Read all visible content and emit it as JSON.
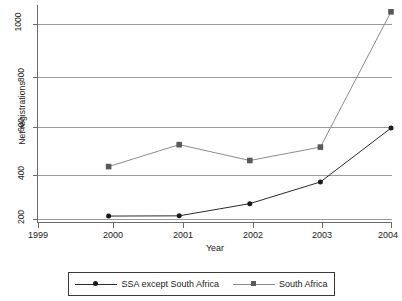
{
  "chart_data": {
    "type": "line",
    "title": "",
    "subtitle": "",
    "xlabel": "Year",
    "ylabel": "Net registrations",
    "x": [
      1999,
      2000,
      2001,
      2002,
      2003,
      2004
    ],
    "x_tick_labels": [
      "1999",
      "2000",
      "2001",
      "2002",
      "2003",
      "2004"
    ],
    "y_tick_labels": [
      "200",
      "400",
      "600",
      "800",
      "1000"
    ],
    "y_ticks": [
      200,
      400,
      600,
      800,
      1000
    ],
    "xlim": [
      1999,
      2004
    ],
    "ylim": [
      180,
      1085
    ],
    "grid": "horizontal",
    "legend_position": "bottom",
    "series": [
      {
        "name": "SSA except South Africa",
        "marker": "circle",
        "color": "#2b2b2b",
        "marker_color": "#1a1a1a",
        "x": [
          2000,
          2001,
          2002,
          2003,
          2004
        ],
        "values": [
          212,
          213,
          263,
          352,
          573
        ]
      },
      {
        "name": "South Africa",
        "marker": "square",
        "color": "#8c8c8c",
        "marker_color": "#595959",
        "x": [
          2000,
          2001,
          2002,
          2003,
          2004
        ],
        "values": [
          415,
          505,
          440,
          495,
          1050
        ]
      }
    ]
  },
  "axes": {
    "y_title": "Net registrations",
    "x_title": "Year"
  },
  "legend": {
    "entries": [
      {
        "label": "SSA except South Africa",
        "marker": "circle",
        "line_color": "#2b2b2b",
        "marker_color": "#1a1a1a"
      },
      {
        "label": "South Africa",
        "marker": "square",
        "line_color": "#8c8c8c",
        "marker_color": "#595959"
      }
    ]
  },
  "y_tick_labels": {
    "t200": "200",
    "t400": "400",
    "t600": "600",
    "t800": "800",
    "t1000": "1000"
  },
  "x_tick_labels": {
    "t1999": "1999",
    "t2000": "2000",
    "t2001": "2001",
    "t2002": "2002",
    "t2003": "2003",
    "t2004": "2004"
  }
}
